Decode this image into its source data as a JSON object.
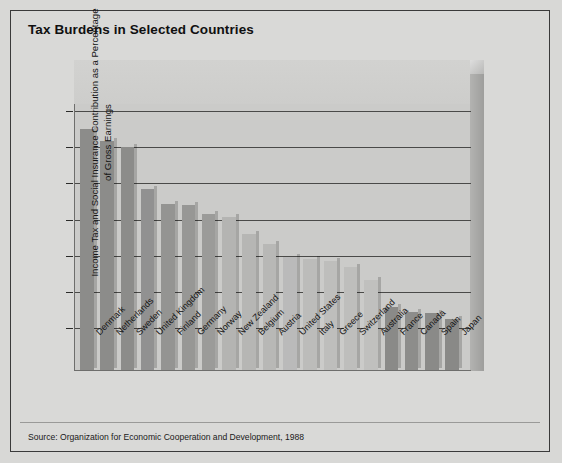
{
  "figure": {
    "title": "Tax Burdens in Selected Countries",
    "source": "Source: Organization for Economic Cooperation and Development, 1988"
  },
  "chart_data": {
    "type": "bar",
    "title": "Tax Burdens in Selected Countries",
    "xlabel": "",
    "ylabel": "Income Tax and Social Insurance Contribution as a Percentage of Gross Earnings",
    "ylim": [
      0,
      42
    ],
    "yticks": [
      0,
      10,
      15,
      20,
      25,
      30,
      35,
      40
    ],
    "ytick_labels": [
      "0",
      "10",
      "15",
      "20",
      "25",
      "30",
      "35",
      "40"
    ],
    "axis_note": "y-axis has a break between 0 and 10",
    "grid": true,
    "legend": null,
    "categories": [
      "Denmark",
      "Netherlands",
      "Sweden",
      "United Kingdom",
      "Finland",
      "Germany",
      "Norway",
      "New Zealand",
      "Belgium",
      "Austria",
      "United States",
      "Italy",
      "Greece",
      "Switzerland",
      "Australia",
      "France",
      "Canada",
      "Spain",
      "Japan"
    ],
    "values": [
      37.5,
      35.8,
      35.0,
      29.2,
      27.1,
      27.0,
      25.8,
      25.4,
      23.0,
      21.6,
      19.8,
      19.6,
      19.3,
      18.5,
      16.7,
      12.9,
      12.2,
      12.1,
      11.3
    ],
    "bar_colors": [
      "#8c8c8a",
      "#8c8c8a",
      "#8c8c8a",
      "#919191",
      "#949492",
      "#979795",
      "#9b9b99",
      "#b4b4b2",
      "#b6b6b4",
      "#b8b8b6",
      "#bababa",
      "#bcbcba",
      "#bebebc",
      "#bebebc",
      "#c0c0be",
      "#8a8a88",
      "#8d8d8b",
      "#8a8a88",
      "#898987"
    ]
  },
  "palette": {
    "page_background": "#d8d8d6",
    "panel_background": "#cbcbc9",
    "axis_line": "#4a4a48",
    "text": "#141414"
  }
}
